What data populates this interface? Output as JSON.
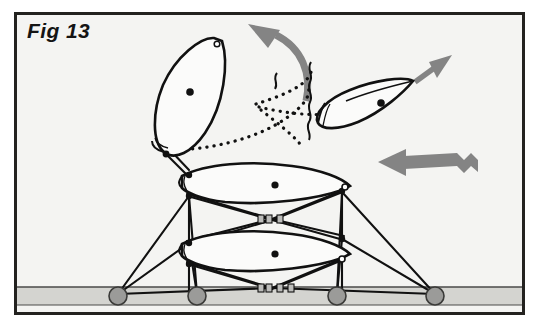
{
  "figure": {
    "label": "Fig 13",
    "frame": {
      "border_color": "#23221f",
      "background_color": "#f4f4f2",
      "x": 14,
      "y": 12,
      "width": 511,
      "height": 303
    },
    "ground": {
      "name": "ground-strip",
      "fill_color": "#d4d4d0",
      "line_color": "#4a4a48",
      "top_y": 287,
      "bottom_y": 304,
      "left_x": 17,
      "right_x": 522
    },
    "colors": {
      "ink": "#111111",
      "arrow_gray": "#848484",
      "anchor_fill": "#9b9b99",
      "anchor_stroke": "#3a3a38",
      "connector_fill": "#bdbdbb",
      "sheet_fill": "#fbfbfa"
    },
    "ground_anchors": [
      {
        "name": "ground-anchor-1",
        "cx": 118,
        "cy": 296,
        "r": 9
      },
      {
        "name": "ground-anchor-2",
        "cx": 197,
        "cy": 296,
        "r": 9
      },
      {
        "name": "ground-anchor-3",
        "cx": 337,
        "cy": 296,
        "r": 9
      },
      {
        "name": "ground-anchor-4",
        "cx": 435,
        "cy": 296,
        "r": 9
      }
    ],
    "wings": [
      {
        "name": "wing-stack-upper",
        "role": "tethered stacked wing, upper",
        "center_dot": {
          "cx": 275,
          "cy": 185
        },
        "outline": "M 182,176 C 205,164 250,160 292,166 C 322,170 342,178 350,186 L 342,190 C 320,198 270,206 225,202 C 200,199 186,192 182,188 Z"
      },
      {
        "name": "wing-stack-lower",
        "role": "tethered stacked wing, lower",
        "center_dot": {
          "cx": 275,
          "cy": 254
        },
        "outline": "M 182,244 C 205,232 250,228 292,234 C 322,238 342,246 350,254 L 342,258 C 320,266 270,274 225,270 C 200,267 186,260 182,256 Z"
      },
      {
        "name": "wing-detaching",
        "role": "wing tilting away from stack, solid outline",
        "center_dot": {
          "cx": 190,
          "cy": 92
        },
        "outline": "M 222,41 C 228,62 224,104 205,133 C 192,152 175,160 164,152 C 152,143 152,112 163,85 C 175,57 200,38 214,38 Z"
      },
      {
        "name": "wing-free-flying",
        "role": "released wing in free flight",
        "center_dot": {
          "cx": 381,
          "cy": 103
        },
        "outline": "M 413,81 C 404,92 382,112 358,122 C 338,130 322,130 318,123 C 313,114 327,99 350,90 C 374,80 404,76 413,81 Z"
      }
    ],
    "ghost_outline": {
      "name": "ghost-wing-outline",
      "role": "dotted former position of detaching wing",
      "style": "dotted"
    },
    "arrows": [
      {
        "name": "rotation-arrow-curved",
        "role": "curved motion arrow showing wing rotating up and away",
        "direction": "up-left",
        "color": "#848484"
      },
      {
        "name": "flight-arrow-straight",
        "role": "straight arrow showing free wing flight direction",
        "direction": "up-right",
        "color": "#848484"
      },
      {
        "name": "wind-arrow-wavy",
        "role": "wavy arrow showing wind / airflow direction",
        "direction": "left",
        "color": "#848484"
      }
    ],
    "connectors": [
      {
        "name": "bridle-connector-upper",
        "cx": 272,
        "cy": 219
      },
      {
        "name": "bridle-connector-lower",
        "cx": 272,
        "cy": 288
      }
    ]
  }
}
